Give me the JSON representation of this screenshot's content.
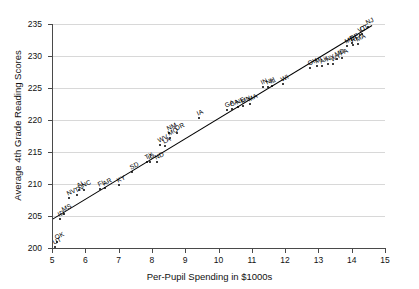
{
  "chart_data": {
    "type": "scatter",
    "title": "",
    "xlabel": "Per-Pupil Spending in $1000s",
    "ylabel": "Average 4th Grade Reading Scores",
    "xlim": [
      5,
      15
    ],
    "ylim": [
      200,
      235
    ],
    "xticks": [
      5,
      6,
      7,
      8,
      9,
      10,
      11,
      12,
      13,
      14,
      15
    ],
    "yticks": [
      200,
      205,
      210,
      215,
      220,
      225,
      230,
      235
    ],
    "grid": "horizontal",
    "legend": "none",
    "point_label_type": "state-abbreviation",
    "trendline": {
      "type": "linear-fit",
      "x_start": 5.0,
      "y_start": 204.6,
      "x_end": 14.6,
      "y_end": 234.9,
      "color": "#000000"
    },
    "points": [
      {
        "label": "UT",
        "x": 5.1,
        "y": 200.2
      },
      {
        "label": "OK",
        "x": 5.15,
        "y": 201.0
      },
      {
        "label": "ID",
        "x": 5.25,
        "y": 204.6
      },
      {
        "label": "MS",
        "x": 5.35,
        "y": 205.3
      },
      {
        "label": "NV",
        "x": 5.5,
        "y": 207.8
      },
      {
        "label": "TN",
        "x": 5.75,
        "y": 208.3
      },
      {
        "label": "AL",
        "x": 5.8,
        "y": 209.0
      },
      {
        "label": "NC",
        "x": 5.95,
        "y": 209.1
      },
      {
        "label": "FL",
        "x": 6.45,
        "y": 209.2
      },
      {
        "label": "AR",
        "x": 6.6,
        "y": 209.3
      },
      {
        "label": "KY",
        "x": 7.0,
        "y": 209.8
      },
      {
        "label": "SD",
        "x": 7.4,
        "y": 211.9
      },
      {
        "label": "TX",
        "x": 7.85,
        "y": 213.4
      },
      {
        "label": "ID",
        "x": 7.95,
        "y": 213.4
      },
      {
        "label": "ND",
        "x": 8.15,
        "y": 213.5
      },
      {
        "label": "WV",
        "x": 8.25,
        "y": 216.1
      },
      {
        "label": "LA",
        "x": 8.4,
        "y": 216.0
      },
      {
        "label": "NM",
        "x": 8.5,
        "y": 217.9
      },
      {
        "label": "MO",
        "x": 8.55,
        "y": 217.2
      },
      {
        "label": "OR",
        "x": 8.75,
        "y": 218.0
      },
      {
        "label": "IA",
        "x": 9.4,
        "y": 220.3
      },
      {
        "label": "GA",
        "x": 10.25,
        "y": 221.6
      },
      {
        "label": "CA",
        "x": 10.4,
        "y": 221.7
      },
      {
        "label": "NE",
        "x": 10.6,
        "y": 222.0
      },
      {
        "label": "MN",
        "x": 10.75,
        "y": 222.2
      },
      {
        "label": "MA",
        "x": 10.95,
        "y": 222.5
      },
      {
        "label": "IN",
        "x": 11.35,
        "y": 225.2
      },
      {
        "label": "NH",
        "x": 11.5,
        "y": 225.2
      },
      {
        "label": "IL",
        "x": 11.6,
        "y": 225.3
      },
      {
        "label": "WI",
        "x": 11.95,
        "y": 225.6
      },
      {
        "label": "OH",
        "x": 12.75,
        "y": 228.2
      },
      {
        "label": "MI",
        "x": 12.95,
        "y": 228.4
      },
      {
        "label": "AK",
        "x": 13.1,
        "y": 228.5
      },
      {
        "label": "NY",
        "x": 13.3,
        "y": 228.7
      },
      {
        "label": "WY",
        "x": 13.45,
        "y": 228.8
      },
      {
        "label": "MD",
        "x": 13.55,
        "y": 229.6
      },
      {
        "label": "PA",
        "x": 13.7,
        "y": 229.7
      },
      {
        "label": "ME",
        "x": 13.85,
        "y": 231.6
      },
      {
        "label": "DE",
        "x": 14.0,
        "y": 232.0
      },
      {
        "label": "RI",
        "x": 14.05,
        "y": 231.7
      },
      {
        "label": "MA",
        "x": 14.2,
        "y": 231.8
      },
      {
        "label": "VT",
        "x": 14.25,
        "y": 233.3
      },
      {
        "label": "CT",
        "x": 14.3,
        "y": 233.4
      },
      {
        "label": "NJ",
        "x": 14.5,
        "y": 234.6
      }
    ]
  }
}
